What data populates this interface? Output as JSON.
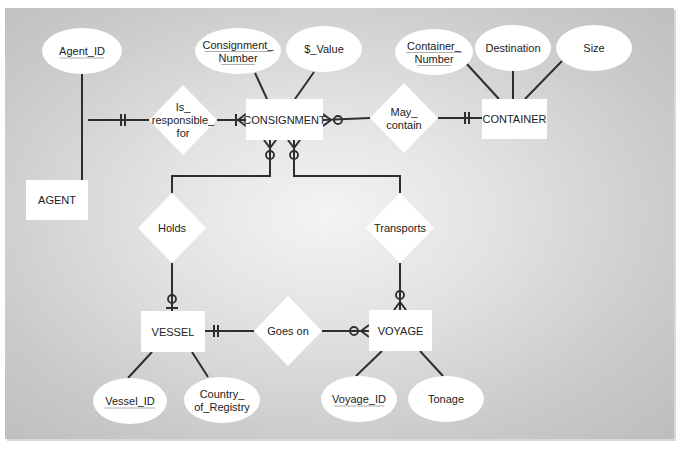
{
  "diagram": {
    "title": "",
    "colors": {
      "line": "#2e2e2e",
      "shape_fill": "#ffffff",
      "text": "#222222",
      "underline": "#9a9a9a"
    },
    "entities": [
      {
        "id": "agent",
        "label": "AGENT",
        "x": 26,
        "y": 180,
        "w": 62,
        "h": 40
      },
      {
        "id": "consignment",
        "label": "CONSIGNMENT",
        "x": 246,
        "y": 99,
        "w": 77,
        "h": 41
      },
      {
        "id": "container",
        "label": "CONTAINER",
        "x": 482,
        "y": 99,
        "w": 65,
        "h": 40
      },
      {
        "id": "vessel",
        "label": "VESSEL",
        "x": 141,
        "y": 311,
        "w": 64,
        "h": 41
      },
      {
        "id": "voyage",
        "label": "VOYAGE",
        "x": 369,
        "y": 310,
        "w": 63,
        "h": 41
      }
    ],
    "relationships": [
      {
        "id": "is_responsible_for",
        "lines": [
          "Is_",
          "responsible_",
          "for"
        ],
        "cx": 183,
        "cy": 120,
        "rx": 34,
        "ry": 35
      },
      {
        "id": "may_contain",
        "lines": [
          "May_",
          "contain"
        ],
        "cx": 404,
        "cy": 118,
        "rx": 34,
        "ry": 35
      },
      {
        "id": "holds",
        "lines": [
          "Holds"
        ],
        "cx": 172,
        "cy": 228,
        "rx": 34,
        "ry": 35
      },
      {
        "id": "transports",
        "lines": [
          "Transports"
        ],
        "cx": 400,
        "cy": 228,
        "rx": 34,
        "ry": 35
      },
      {
        "id": "goes_on",
        "lines": [
          "Goes on"
        ],
        "cx": 288,
        "cy": 331,
        "rx": 34,
        "ry": 35
      }
    ],
    "attributes": [
      {
        "id": "agent_id",
        "lines": [
          "Agent_ID"
        ],
        "cx": 82,
        "cy": 51,
        "rx": 40,
        "ry": 23,
        "key": true
      },
      {
        "id": "consignment_number",
        "lines": [
          "Consignment_",
          "Number"
        ],
        "cx": 238,
        "cy": 51,
        "rx": 43,
        "ry": 23,
        "key": true
      },
      {
        "id": "value",
        "lines": [
          "$_Value"
        ],
        "cx": 324,
        "cy": 49,
        "rx": 38,
        "ry": 23,
        "key": false
      },
      {
        "id": "container_number",
        "lines": [
          "Container_",
          "Number"
        ],
        "cx": 434,
        "cy": 52,
        "rx": 39,
        "ry": 23,
        "key": true
      },
      {
        "id": "destination",
        "lines": [
          "Destination"
        ],
        "cx": 513,
        "cy": 48,
        "rx": 38,
        "ry": 23,
        "key": false
      },
      {
        "id": "size",
        "lines": [
          "Size"
        ],
        "cx": 594,
        "cy": 48,
        "rx": 38,
        "ry": 23,
        "key": false
      },
      {
        "id": "vessel_id",
        "lines": [
          "Vessel_ID"
        ],
        "cx": 130,
        "cy": 401,
        "rx": 37,
        "ry": 23,
        "key": true
      },
      {
        "id": "country_of_registry",
        "lines": [
          "Country_",
          "of_Registry"
        ],
        "cx": 222,
        "cy": 400,
        "rx": 38,
        "ry": 23,
        "key": false
      },
      {
        "id": "voyage_id",
        "lines": [
          "Voyage_ID"
        ],
        "cx": 359,
        "cy": 399,
        "rx": 38,
        "ry": 23,
        "key": true
      },
      {
        "id": "tonage",
        "lines": [
          "Tonage"
        ],
        "cx": 446,
        "cy": 399,
        "rx": 38,
        "ry": 23,
        "key": false
      }
    ],
    "attribute_links": [
      {
        "from": "agent_id",
        "x1": 82,
        "y1": 74,
        "x2": 82,
        "y2": 180
      },
      {
        "from": "consignment_number",
        "x1": 255,
        "y1": 73,
        "x2": 267,
        "y2": 99
      },
      {
        "from": "value",
        "x1": 314,
        "y1": 72,
        "x2": 295,
        "y2": 99
      },
      {
        "from": "container_number",
        "x1": 465,
        "y1": 62,
        "x2": 499,
        "y2": 99
      },
      {
        "from": "destination",
        "x1": 513,
        "y1": 71,
        "x2": 513,
        "y2": 99
      },
      {
        "from": "size",
        "x1": 562,
        "y1": 61,
        "x2": 525,
        "y2": 99
      },
      {
        "from": "vessel_id",
        "x1": 128,
        "y1": 378,
        "x2": 152,
        "y2": 352
      },
      {
        "from": "country_of_registry",
        "x1": 208,
        "y1": 377,
        "x2": 192,
        "y2": 352
      },
      {
        "from": "voyage_id",
        "x1": 356,
        "y1": 376,
        "x2": 382,
        "y2": 351
      },
      {
        "from": "tonage",
        "x1": 443,
        "y1": 376,
        "x2": 420,
        "y2": 351
      }
    ],
    "relationship_links": [
      {
        "points": [
          [
            88,
            120
          ],
          [
            149,
            120
          ]
        ],
        "end_marker": {
          "type": "one-mandatory",
          "at": [
            124,
            120
          ],
          "dir": "h"
        }
      },
      {
        "points": [
          [
            217,
            120
          ],
          [
            246,
            120
          ]
        ],
        "end_marker": {
          "type": "one-or-many",
          "at": [
            246,
            120
          ],
          "dir": "left"
        }
      },
      {
        "points": [
          [
            323,
            120
          ],
          [
            370,
            118
          ]
        ],
        "end_marker": {
          "type": "zero-or-many",
          "at": [
            323,
            120
          ],
          "dir": "right"
        }
      },
      {
        "points": [
          [
            438,
            118
          ],
          [
            482,
            118
          ]
        ],
        "end_marker": {
          "type": "one-mandatory",
          "at": [
            468,
            118
          ],
          "dir": "h"
        }
      },
      {
        "points": [
          [
            270,
            140
          ],
          [
            270,
            176
          ],
          [
            172,
            176
          ],
          [
            172,
            193
          ]
        ],
        "end_marker": {
          "type": "zero-or-many",
          "at": [
            270,
            140
          ],
          "dir": "down"
        }
      },
      {
        "points": [
          [
            294,
            140
          ],
          [
            294,
            176
          ],
          [
            400,
            176
          ],
          [
            400,
            193
          ]
        ],
        "end_marker": {
          "type": "zero-or-many",
          "at": [
            294,
            140
          ],
          "dir": "down"
        }
      },
      {
        "points": [
          [
            172,
            263
          ],
          [
            172,
            311
          ]
        ],
        "end_marker": {
          "type": "zero-or-one",
          "at": [
            172,
            311
          ],
          "dir": "up"
        }
      },
      {
        "points": [
          [
            400,
            263
          ],
          [
            400,
            310
          ]
        ],
        "end_marker": {
          "type": "zero-or-many",
          "at": [
            400,
            310
          ],
          "dir": "up"
        }
      },
      {
        "points": [
          [
            205,
            331
          ],
          [
            254,
            331
          ]
        ],
        "end_marker": {
          "type": "one-mandatory",
          "at": [
            217,
            331
          ],
          "dir": "h"
        }
      },
      {
        "points": [
          [
            322,
            331
          ],
          [
            369,
            331
          ]
        ],
        "end_marker": {
          "type": "zero-or-many",
          "at": [
            369,
            331
          ],
          "dir": "left-in"
        }
      }
    ]
  }
}
